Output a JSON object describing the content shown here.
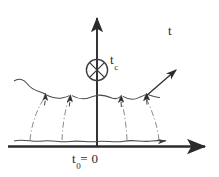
{
  "figure": {
    "kind": "spacetime-diagram",
    "background_color": "#ffffff",
    "ink_color": "#2b2b2b",
    "width": 219,
    "height": 177,
    "labels": {
      "time_axis": "t",
      "critical_time_base": "t",
      "critical_time_sub": "c",
      "initial_time_base": "t",
      "initial_time_sub": "0",
      "initial_time_equals": "= 0"
    },
    "axes": {
      "vertical": {
        "name": "time-axis",
        "label": "t",
        "x": 97,
        "top_y": 12,
        "bottom_y": 146,
        "arrow": "up"
      },
      "horizontal": {
        "name": "space-axis",
        "label": "t0 = 0",
        "y": 146,
        "left_x": 8,
        "right_x": 212,
        "arrow": "right"
      }
    },
    "marker": {
      "name": "crossed-circle-marker",
      "label": "t_c",
      "cx": 97,
      "cy": 70,
      "r": 11,
      "glyph": "crossed-circle"
    },
    "wavy_line": {
      "name": "wavy-worldline",
      "y": 95,
      "start_x": 14,
      "end_x": 160,
      "amplitude": 3.5
    },
    "bottom_wavy_line": {
      "name": "bottom-wavy-line",
      "y": 140,
      "start_x": 14,
      "end_x": 168,
      "amplitude": 2.5,
      "arrow": "right"
    },
    "up_arrows": [
      {
        "name": "up-arrow-1",
        "tip_x": 45,
        "tip_y": 94,
        "base_x": 30,
        "base_y": 140
      },
      {
        "name": "up-arrow-2",
        "tip_x": 70,
        "tip_y": 96,
        "base_x": 62,
        "base_y": 140
      },
      {
        "name": "up-arrow-3",
        "tip_x": 121,
        "tip_y": 96,
        "base_x": 127,
        "base_y": 140
      },
      {
        "name": "up-arrow-4",
        "tip_x": 146,
        "tip_y": 94,
        "base_x": 159,
        "base_y": 140
      }
    ],
    "escaping_arrow": {
      "name": "escaping-arrow",
      "start_x": 145,
      "start_y": 96,
      "end_x": 178,
      "end_y": 68
    },
    "left_curl": {
      "name": "left-wave-curl",
      "start_x": 14,
      "start_y": 80
    }
  }
}
